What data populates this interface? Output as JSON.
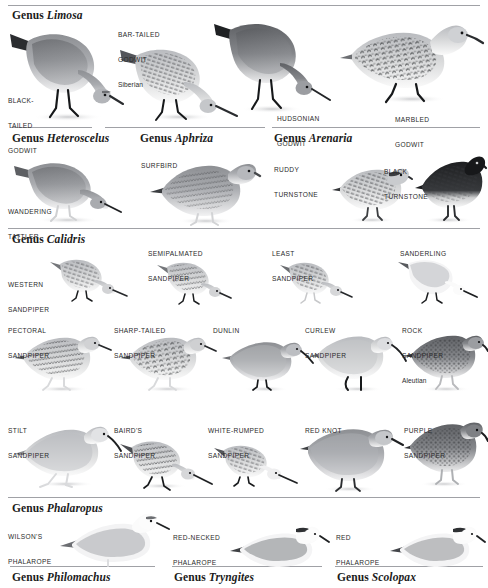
{
  "page": {
    "background": "#ffffff",
    "rule_color": "#8f9196"
  },
  "sections": [
    {
      "id": "limosa",
      "genus_word": "Genus",
      "genus_name": "Limosa",
      "species": [
        {
          "id": "black-tailed-godwit",
          "lines": [
            "BLACK-",
            "TAILED",
            "GODWIT"
          ],
          "sub": ""
        },
        {
          "id": "bar-tailed-godwit",
          "lines": [
            "BAR-TAILED",
            "GODWIT"
          ],
          "sub": "Siberian"
        },
        {
          "id": "hudsonian-godwit",
          "lines": [
            "HUDSONIAN",
            "GODWIT"
          ],
          "sub": ""
        },
        {
          "id": "marbled-godwit",
          "lines": [
            "MARBLED",
            "GODWIT"
          ],
          "sub": ""
        }
      ]
    },
    {
      "id": "heteroscelus",
      "genus_word": "Genus",
      "genus_name": "Heteroscelus",
      "species": [
        {
          "id": "wandering-tattler",
          "lines": [
            "WANDERING",
            "TATTLER"
          ],
          "sub": ""
        }
      ]
    },
    {
      "id": "aphriza",
      "genus_word": "Genus",
      "genus_name": "Aphriza",
      "species": [
        {
          "id": "surfbird",
          "lines": [
            "SURFBIRD"
          ],
          "sub": ""
        }
      ]
    },
    {
      "id": "arenaria",
      "genus_word": "Genus",
      "genus_name": "Arenaria",
      "species": [
        {
          "id": "ruddy-turnstone",
          "lines": [
            "RUDDY",
            "TURNSTONE"
          ],
          "sub": ""
        },
        {
          "id": "black-turnstone",
          "lines": [
            "BLACK",
            "TURNSTONE"
          ],
          "sub": ""
        }
      ]
    },
    {
      "id": "calidris",
      "genus_word": "Genus",
      "genus_name": "Calidris",
      "species": [
        {
          "id": "western-sandpiper",
          "lines": [
            "WESTERN",
            "SANDPIPER"
          ],
          "sub": ""
        },
        {
          "id": "semipalmated-sandpiper",
          "lines": [
            "SEMIPALMATED",
            "SANDPIPER"
          ],
          "sub": ""
        },
        {
          "id": "least-sandpiper",
          "lines": [
            "LEAST",
            "SANDPIPER"
          ],
          "sub": ""
        },
        {
          "id": "sanderling",
          "lines": [
            "SANDERLING"
          ],
          "sub": ""
        },
        {
          "id": "pectoral-sandpiper",
          "lines": [
            "PECTORAL",
            "SANDPIPER"
          ],
          "sub": ""
        },
        {
          "id": "sharp-tailed-sandpiper",
          "lines": [
            "SHARP-TAILED",
            "SANDPIPER"
          ],
          "sub": ""
        },
        {
          "id": "dunlin",
          "lines": [
            "DUNLIN"
          ],
          "sub": ""
        },
        {
          "id": "curlew-sandpiper",
          "lines": [
            "CURLEW",
            "SANDPIPER"
          ],
          "sub": ""
        },
        {
          "id": "rock-sandpiper",
          "lines": [
            "ROCK",
            "SANDPIPER"
          ],
          "sub": "Aleutian"
        },
        {
          "id": "stilt-sandpiper",
          "lines": [
            "STILT",
            "SANDPIPER"
          ],
          "sub": ""
        },
        {
          "id": "bairds-sandpiper",
          "lines": [
            "BAIRD'S",
            "SANDPIPER"
          ],
          "sub": ""
        },
        {
          "id": "white-rumped-sandpiper",
          "lines": [
            "WHITE-RUMPED",
            "SANDPIPER"
          ],
          "sub": ""
        },
        {
          "id": "red-knot",
          "lines": [
            "RED KNOT"
          ],
          "sub": ""
        },
        {
          "id": "purple-sandpiper",
          "lines": [
            "PURPLE",
            "SANDPIPER"
          ],
          "sub": ""
        }
      ]
    },
    {
      "id": "phalaropus",
      "genus_word": "Genus",
      "genus_name": "Phalaropus",
      "species": [
        {
          "id": "wilsons-phalarope",
          "lines": [
            "WILSON'S",
            "PHALAROPE"
          ],
          "sub": ""
        },
        {
          "id": "red-necked-phalarope",
          "lines": [
            "RED-NECKED",
            "PHALAROPE"
          ],
          "sub": ""
        },
        {
          "id": "red-phalarope",
          "lines": [
            "RED",
            "PHALAROPE"
          ],
          "sub": ""
        }
      ]
    },
    {
      "id": "philomachus",
      "genus_word": "Genus",
      "genus_name": "Philomachus",
      "species": []
    },
    {
      "id": "tryngites",
      "genus_word": "Genus",
      "genus_name": "Tryngites",
      "species": []
    },
    {
      "id": "scolopax",
      "genus_word": "Genus",
      "genus_name": "Scolopax",
      "species": []
    }
  ]
}
